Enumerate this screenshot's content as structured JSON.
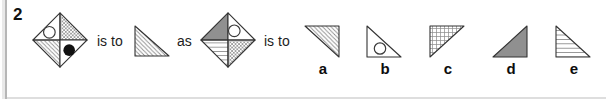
{
  "question": {
    "number": "2",
    "relation_1": "is to",
    "relation_2": "as",
    "relation_3": "is to"
  },
  "figures": {
    "diamond_left": {
      "shape": "diamond divided into four triangular quadrants",
      "quadrants": {
        "top_left": "white with outlined circle",
        "top_right": "diagonal crosshatch",
        "bottom_left": "diagonal hatch",
        "bottom_right": "white with filled black circle"
      }
    },
    "answer_triangle_left": {
      "shape": "right triangle, right angle at bottom-left, hypotenuse top-left to bottom-right",
      "fill": "diagonal hatch"
    },
    "diamond_right": {
      "shape": "diamond divided into four triangular quadrants",
      "quadrants": {
        "top_left": "solid gray",
        "top_right": "white with outlined circle",
        "bottom_left": "horizontal lines",
        "bottom_right": "diagonal crosshatch"
      }
    }
  },
  "options": [
    {
      "label": "a",
      "shape": "right triangle, right angle top-right",
      "fill": "diagonal hatch"
    },
    {
      "label": "b",
      "shape": "right triangle, right angle bottom-left",
      "fill": "white with outlined circle"
    },
    {
      "label": "c",
      "shape": "right triangle, right angle top-left",
      "fill": "square grid"
    },
    {
      "label": "d",
      "shape": "right triangle, right angle bottom-right",
      "fill": "solid gray"
    },
    {
      "label": "e",
      "shape": "right triangle, right angle bottom-left",
      "fill": "horizontal lines"
    }
  ],
  "colors": {
    "background": "#ffffff",
    "outline": "#333333",
    "hatch_stroke": "#8c8c8c",
    "solid_gray_fill": "#909090",
    "black_dot": "#111111",
    "page_edge": "#b6b6b6",
    "bottom_rule": "#dedede",
    "text": "#1c1c1c"
  }
}
